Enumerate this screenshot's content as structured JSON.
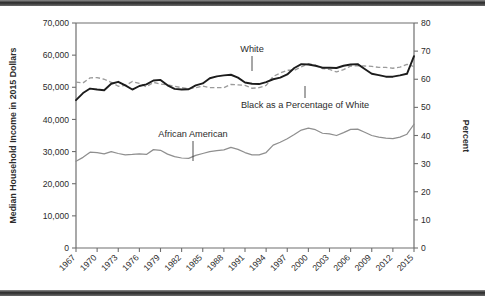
{
  "chart_data": {
    "type": "line",
    "title": "",
    "xlabel": "",
    "ylabel": "Median Household Income in 2015 Dollars",
    "y2label": "Percent",
    "ylim": [
      0,
      70000
    ],
    "y2lim": [
      0,
      80
    ],
    "xlim": [
      1967,
      2015
    ],
    "grid": false,
    "legend_position": "inline-annotations",
    "y_ticks": [
      "0",
      "10,000",
      "20,000",
      "30,000",
      "40,000",
      "50,000",
      "60,000",
      "70,000"
    ],
    "y_tick_values": [
      0,
      10000,
      20000,
      30000,
      40000,
      50000,
      60000,
      70000
    ],
    "y2_ticks": [
      "0",
      "10",
      "20",
      "30",
      "40",
      "50",
      "60",
      "70",
      "80"
    ],
    "y2_tick_values": [
      0,
      10,
      20,
      30,
      40,
      50,
      60,
      70,
      80
    ],
    "x_ticks": [
      "1967",
      "1970",
      "1973",
      "1976",
      "1979",
      "1982",
      "1985",
      "1988",
      "1991",
      "1994",
      "1997",
      "2000",
      "2003",
      "2006",
      "2009",
      "2012",
      "2015"
    ],
    "x_tick_values": [
      1967,
      1970,
      1973,
      1976,
      1979,
      1982,
      1985,
      1988,
      1991,
      1994,
      1997,
      2000,
      2003,
      2006,
      2009,
      2012,
      2015
    ],
    "x": [
      1967,
      1968,
      1969,
      1970,
      1971,
      1972,
      1973,
      1974,
      1975,
      1976,
      1977,
      1978,
      1979,
      1980,
      1981,
      1982,
      1983,
      1984,
      1985,
      1986,
      1987,
      1988,
      1989,
      1990,
      1991,
      1992,
      1993,
      1994,
      1995,
      1996,
      1997,
      1998,
      1999,
      2000,
      2001,
      2002,
      2003,
      2004,
      2005,
      2006,
      2007,
      2008,
      2009,
      2010,
      2011,
      2012,
      2013,
      2014,
      2015
    ],
    "series": [
      {
        "name": "White",
        "axis": "left",
        "style": "solid-dark",
        "values": [
          46000,
          48200,
          49600,
          49300,
          49100,
          51100,
          51700,
          50600,
          49300,
          50400,
          50900,
          52100,
          52300,
          50600,
          49500,
          49300,
          49400,
          50600,
          51200,
          52800,
          53400,
          53700,
          53900,
          53000,
          51500,
          51100,
          51000,
          51600,
          52500,
          53000,
          54000,
          56000,
          57200,
          57100,
          56700,
          56100,
          56100,
          56000,
          56700,
          57100,
          57200,
          55700,
          54200,
          53800,
          53300,
          53300,
          53700,
          54200,
          59700
        ]
      },
      {
        "name": "African American",
        "axis": "left",
        "style": "solid-gray",
        "values": [
          27000,
          28200,
          29800,
          29700,
          29300,
          30000,
          29400,
          29000,
          29100,
          29300,
          29100,
          30600,
          30400,
          29200,
          28400,
          28000,
          27900,
          28800,
          29400,
          30000,
          30300,
          30500,
          31300,
          30700,
          29700,
          29000,
          29000,
          29700,
          32000,
          32900,
          34000,
          35300,
          36700,
          37300,
          36800,
          35700,
          35500,
          35000,
          35900,
          36900,
          37000,
          36000,
          35000,
          34500,
          34200,
          34000,
          34500,
          35400,
          38500
        ]
      },
      {
        "name": "Black as a Percentage of White",
        "axis": "right",
        "style": "dashed-gray",
        "values": [
          59.0,
          58.7,
          60.5,
          60.6,
          60.0,
          58.9,
          57.5,
          57.8,
          59.2,
          58.5,
          57.3,
          58.9,
          58.3,
          58.0,
          57.5,
          57.0,
          56.6,
          57.0,
          57.6,
          57.0,
          57.0,
          57.0,
          58.2,
          58.0,
          57.8,
          56.8,
          57.0,
          57.8,
          61.0,
          62.2,
          63.2,
          63.2,
          64.4,
          65.5,
          65.0,
          63.8,
          63.5,
          62.6,
          63.4,
          64.7,
          64.8,
          64.7,
          64.6,
          64.2,
          64.2,
          63.9,
          64.3,
          65.3,
          64.5
        ]
      }
    ],
    "annotations": [
      {
        "text": "White",
        "series": "White",
        "x_pixel_frac": 0.52,
        "leader": true
      },
      {
        "text": "Black as a Percentage of White",
        "series": "Black as a Percentage of White",
        "leader": true
      },
      {
        "text": "African American",
        "series": "African American",
        "leader": true
      }
    ],
    "colors": {
      "white_line": "#1c1c1c",
      "african_american_line": "#8f8f8f",
      "ratio_line": "#9b9b9b",
      "axis": "#6f6f6f",
      "text": "#2b2b2b",
      "background": "#ffffff",
      "figure_rule": "#2a2a2a"
    }
  }
}
